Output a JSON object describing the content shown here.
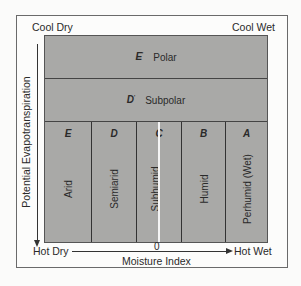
{
  "corners": {
    "top_left": "Cool Dry",
    "top_right": "Cool Wet",
    "bottom_left": "Hot Dry",
    "bottom_right": "Hot Wet"
  },
  "axes": {
    "y_label": "Potential Evapotranspiration",
    "x_label": "Moisture Index",
    "x_zero": "0"
  },
  "rows": [
    {
      "letter": "E",
      "prime": "'",
      "name": "Polar"
    },
    {
      "letter": "D",
      "prime": "'",
      "name": "Subpolar"
    }
  ],
  "columns": [
    {
      "letter": "E",
      "name": "Arid"
    },
    {
      "letter": "D",
      "name": "Semiarid"
    },
    {
      "letter": "C",
      "name": "Subhumid"
    },
    {
      "letter": "B",
      "name": "Humid"
    },
    {
      "letter": "A",
      "name": "Perhumid (Wet)"
    }
  ],
  "colors": {
    "fill": "#a9a9a7",
    "lines": "#333333",
    "zero_line": "#f4f4f4"
  }
}
